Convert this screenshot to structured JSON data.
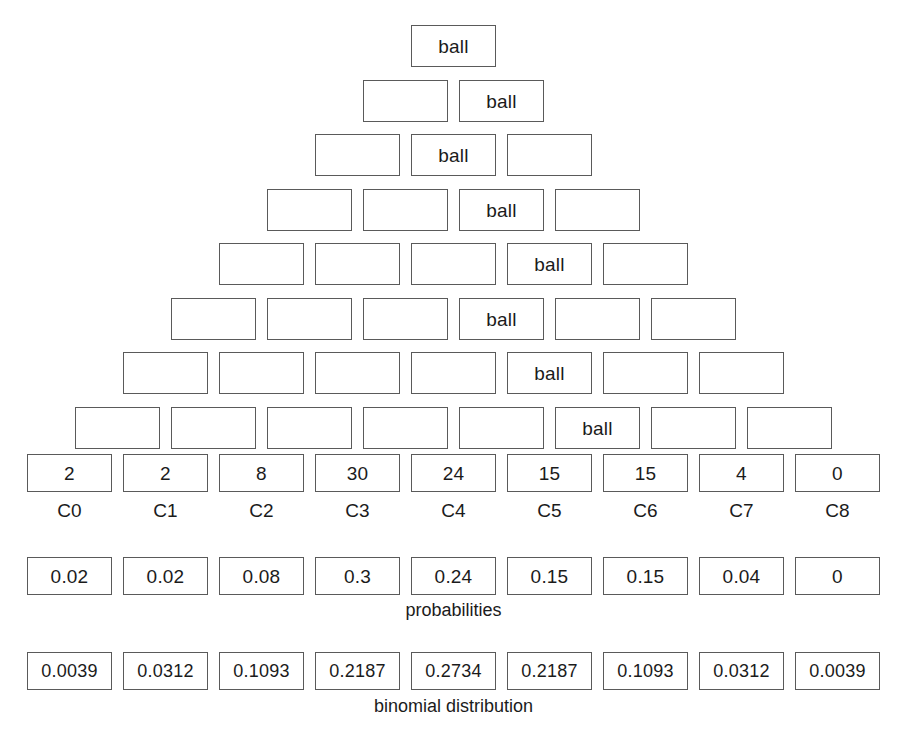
{
  "diagram": {
    "ball_label": "ball",
    "border_color": "#5a5a5a",
    "text_color": "#1b1b1b",
    "background_color": "#ffffff"
  },
  "pyramid": {
    "rows": [
      {
        "count": 1,
        "ball_index": 0,
        "cells": [
          "ball"
        ]
      },
      {
        "count": 2,
        "ball_index": 1,
        "cells": [
          "",
          "ball"
        ]
      },
      {
        "count": 3,
        "ball_index": 1,
        "cells": [
          "",
          "ball",
          ""
        ]
      },
      {
        "count": 4,
        "ball_index": 2,
        "cells": [
          "",
          "",
          "ball",
          ""
        ]
      },
      {
        "count": 5,
        "ball_index": 3,
        "cells": [
          "",
          "",
          "",
          "ball",
          ""
        ]
      },
      {
        "count": 6,
        "ball_index": 3,
        "cells": [
          "",
          "",
          "",
          "ball",
          "",
          ""
        ]
      },
      {
        "count": 7,
        "ball_index": 4,
        "cells": [
          "",
          "",
          "",
          "",
          "ball",
          "",
          ""
        ]
      },
      {
        "count": 8,
        "ball_index": 5,
        "cells": [
          "",
          "",
          "",
          "",
          "",
          "ball",
          "",
          ""
        ]
      }
    ]
  },
  "counts": {
    "values": [
      "2",
      "2",
      "8",
      "30",
      "24",
      "15",
      "15",
      "4",
      "0"
    ],
    "labels": [
      "C0",
      "C1",
      "C2",
      "C3",
      "C4",
      "C5",
      "C6",
      "C7",
      "C8"
    ]
  },
  "probabilities": {
    "values": [
      "0.02",
      "0.02",
      "0.08",
      "0.3",
      "0.24",
      "0.15",
      "0.15",
      "0.04",
      "0"
    ],
    "caption": "probabilities"
  },
  "binomial": {
    "values": [
      "0.0039",
      "0.0312",
      "0.1093",
      "0.2187",
      "0.2734",
      "0.2187",
      "0.1093",
      "0.0312",
      "0.0039"
    ],
    "caption": "binomial distribution"
  },
  "chart_data": {
    "type": "bar",
    "categories": [
      "C0",
      "C1",
      "C2",
      "C3",
      "C4",
      "C5",
      "C6",
      "C7",
      "C8"
    ],
    "series": [
      {
        "name": "counts",
        "values": [
          2,
          2,
          8,
          30,
          24,
          15,
          15,
          4,
          0
        ]
      },
      {
        "name": "probabilities",
        "values": [
          0.02,
          0.02,
          0.08,
          0.3,
          0.24,
          0.15,
          0.15,
          0.04,
          0
        ]
      },
      {
        "name": "binomial distribution",
        "values": [
          0.0039,
          0.0312,
          0.1093,
          0.2187,
          0.2734,
          0.2187,
          0.1093,
          0.0312,
          0.0039
        ]
      }
    ],
    "xlabel": "",
    "ylabel": "",
    "grid": false,
    "legend": "none"
  }
}
